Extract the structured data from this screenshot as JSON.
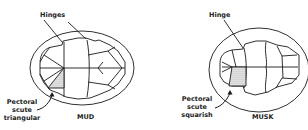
{
  "diagrams": [
    {
      "name": "MUD",
      "title": "MUD",
      "hinge_label": "Hinges",
      "pectoral_label": [
        "Pectoral",
        "scute",
        "triangular"
      ]
    },
    {
      "name": "MUSK",
      "title": "MUSK",
      "hinge_label": "Hinge",
      "pectoral_label": [
        "Pectoral",
        "scute",
        "squarish"
      ]
    }
  ],
  "colors": {
    "line": "#1a1a1a",
    "background": "#ffffff"
  }
}
